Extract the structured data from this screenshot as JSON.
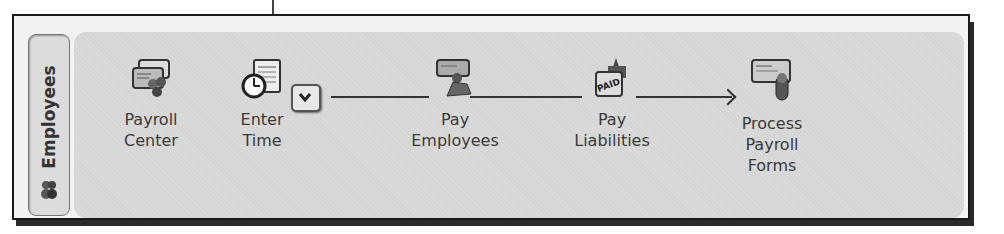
{
  "panel": {
    "tab_label": "Employees",
    "tab_icon": "employees-people-icon"
  },
  "workflow": {
    "nodes": [
      {
        "id": "payroll-center",
        "line1": "Payroll",
        "line2": "Center",
        "line3": "",
        "icon": "payroll-center-icon"
      },
      {
        "id": "enter-time",
        "line1": "Enter",
        "line2": "Time",
        "line3": "",
        "icon": "clock-timesheet-icon"
      },
      {
        "id": "pay-employees",
        "line1": "Pay",
        "line2": "Employees",
        "line3": "",
        "icon": "pay-employees-icon"
      },
      {
        "id": "pay-liabilities",
        "line1": "Pay",
        "line2": "Liabilities",
        "line3": "",
        "icon": "paid-liabilities-icon"
      },
      {
        "id": "process-payroll-forms",
        "line1": "Process",
        "line2": "Payroll",
        "line3": "Forms",
        "icon": "payroll-forms-icon"
      }
    ],
    "dropdown_icon": "chevron-down-icon"
  },
  "colors": {
    "panel_bg": "#d6d6d6",
    "frame_border": "#1a1a1a",
    "text": "#3a3a3a"
  }
}
